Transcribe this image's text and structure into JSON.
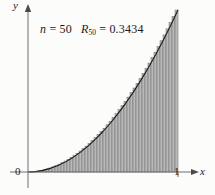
{
  "figure": {
    "caption_n_text": "n",
    "caption_eq1": " = ",
    "caption_n_value": "50",
    "caption_R_text": "R",
    "caption_R_sub": "50",
    "caption_eq2": " = ",
    "caption_R_value": "0.3434",
    "y_axis_label": "y",
    "x_axis_label": "x",
    "origin_label": "0",
    "tick_one_label": "1"
  },
  "colors": {
    "axis": "#6f6f6f",
    "curve": "#1a1a1a",
    "bar_fill": "#b9b9b9",
    "bar_stroke": "#6a6a6a",
    "text": "#1a1a1a",
    "background": "#fcfcfa"
  },
  "chart_data": {
    "type": "bar",
    "title": "",
    "subtitle": "",
    "annotation": "n = 50   R_50 = 0.3434",
    "xlabel": "x",
    "ylabel": "y",
    "xlim": [
      0,
      1
    ],
    "ylim": [
      0,
      1
    ],
    "grid": false,
    "legend": null,
    "x_ticks": [
      0,
      1
    ],
    "x_tick_labels": [
      "0",
      "1"
    ],
    "y_ticks": [],
    "y_tick_labels": [],
    "n_rectangles": 50,
    "riemann_sum_value": 0.3434,
    "riemann_sum_type": "right-endpoint",
    "function_expression": "y = x^2",
    "curve": {
      "name": "y = x^2",
      "x": [
        0.0,
        0.05,
        0.1,
        0.15,
        0.2,
        0.25,
        0.3,
        0.35,
        0.4,
        0.45,
        0.5,
        0.55,
        0.6,
        0.65,
        0.7,
        0.75,
        0.8,
        0.85,
        0.9,
        0.95,
        1.0
      ],
      "y": [
        0.0,
        0.0025,
        0.01,
        0.0225,
        0.04,
        0.0625,
        0.09,
        0.1225,
        0.16,
        0.2025,
        0.25,
        0.3025,
        0.36,
        0.4225,
        0.49,
        0.5625,
        0.64,
        0.7225,
        0.81,
        0.9025,
        1.0
      ]
    },
    "bars": {
      "x_right_edges": [
        0.02,
        0.04,
        0.06,
        0.08,
        0.1,
        0.12,
        0.14,
        0.16,
        0.18,
        0.2,
        0.22,
        0.24,
        0.26,
        0.28,
        0.3,
        0.32,
        0.34,
        0.36,
        0.38,
        0.4,
        0.42,
        0.44,
        0.46,
        0.48,
        0.5,
        0.52,
        0.54,
        0.56,
        0.58,
        0.6,
        0.62,
        0.64,
        0.66,
        0.68,
        0.7,
        0.72,
        0.74,
        0.76,
        0.78,
        0.8,
        0.82,
        0.84,
        0.86,
        0.88,
        0.9,
        0.92,
        0.94,
        0.96,
        0.98,
        1.0
      ],
      "heights": [
        0.0004,
        0.0016,
        0.0036,
        0.0064,
        0.01,
        0.0144,
        0.0196,
        0.0256,
        0.0324,
        0.04,
        0.0484,
        0.0576,
        0.0676,
        0.0784,
        0.09,
        0.1024,
        0.1156,
        0.1296,
        0.1444,
        0.16,
        0.1764,
        0.1936,
        0.2116,
        0.2304,
        0.25,
        0.2704,
        0.2916,
        0.3136,
        0.3364,
        0.36,
        0.3844,
        0.4096,
        0.4356,
        0.4624,
        0.49,
        0.5184,
        0.5476,
        0.5776,
        0.6084,
        0.64,
        0.6724,
        0.7056,
        0.7396,
        0.7744,
        0.81,
        0.8464,
        0.8836,
        0.9216,
        0.9604,
        1.0
      ]
    }
  }
}
